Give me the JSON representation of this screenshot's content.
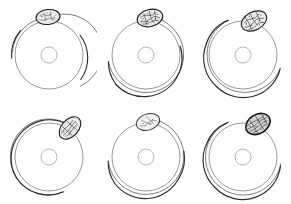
{
  "figure": {
    "background_color": "#ffffff",
    "grid": {
      "rows": 2,
      "columns": 3,
      "panel_count": 6
    },
    "colors": {
      "main_circle_stroke": "#8d8d91",
      "inner_circle_stroke": "#a9a9ad",
      "outer_arc_stroke": "#2b2b2e",
      "outer_arc_soft_stroke": "#6d6d72",
      "nodule_fill": "#e8e8e8",
      "nodule_outline": "#1d1d20"
    },
    "panels": [
      {
        "id": "panel-1",
        "position": {
          "row": 1,
          "column": 1
        },
        "main_circle": {
          "cx": 49,
          "cy": 55,
          "r": 34
        },
        "inner_circle": {
          "cx": 49,
          "cy": 55,
          "r": 8
        },
        "outer_arc": {
          "cx": 49,
          "cy": 55,
          "r": 37.5,
          "start_angle_deg": 182,
          "end_angle_deg": 55,
          "sweep": "clockwise-over-top",
          "clock_start": "9 o'clock",
          "clock_end": "4 o'clock"
        },
        "nodule": {
          "cx": 48,
          "cy": 17,
          "rx": 12,
          "ry": 7.5,
          "rotation_deg": -6,
          "clock_position": "12 o'clock",
          "texture": "stippled",
          "weight": "light"
        }
      },
      {
        "id": "panel-2",
        "position": {
          "row": 1,
          "column": 2
        },
        "main_circle": {
          "cx": 49,
          "cy": 55,
          "r": 34
        },
        "inner_circle": {
          "cx": 49,
          "cy": 55,
          "r": 8
        },
        "outer_arc": {
          "cx": 49,
          "cy": 55,
          "r": 38,
          "start_angle_deg": 168,
          "end_angle_deg": 292,
          "sweep": "counterclockwise-under-bottom",
          "clock_start": "9:30 o'clock",
          "clock_end": "2 o'clock"
        },
        "nodule": {
          "cx": 53,
          "cy": 18,
          "rx": 13,
          "ry": 8.5,
          "rotation_deg": -14,
          "clock_position": "12:30 o'clock",
          "texture": "stippled",
          "weight": "medium"
        }
      },
      {
        "id": "panel-3",
        "position": {
          "row": 1,
          "column": 3
        },
        "main_circle": {
          "cx": 49,
          "cy": 55,
          "r": 34
        },
        "inner_circle": {
          "cx": 49,
          "cy": 55,
          "r": 8
        },
        "outer_arc": {
          "cx": 49,
          "cy": 55,
          "r": 38,
          "start_angle_deg": 200,
          "end_angle_deg": 352,
          "sweep": "counterclockwise-under-bottom",
          "clock_start": "11 o'clock",
          "clock_end": "3 o'clock"
        },
        "nodule": {
          "cx": 60,
          "cy": 21,
          "rx": 13.5,
          "ry": 9,
          "rotation_deg": -28,
          "clock_position": "1 o'clock",
          "texture": "stippled",
          "weight": "medium"
        }
      },
      {
        "id": "panel-4",
        "position": {
          "row": 2,
          "column": 1
        },
        "main_circle": {
          "cx": 49,
          "cy": 55,
          "r": 34
        },
        "inner_circle": {
          "cx": 49,
          "cy": 55,
          "r": 8
        },
        "outer_arc": {
          "cx": 49,
          "cy": 55,
          "r": 38,
          "start_angle_deg": 220,
          "end_angle_deg": 65,
          "sweep": "counterclockwise-over-left",
          "clock_start": "1 o'clock",
          "clock_end": "5 o'clock"
        },
        "nodule": {
          "cx": 70,
          "cy": 26,
          "rx": 13,
          "ry": 8.5,
          "rotation_deg": -48,
          "clock_position": "1:30 o'clock",
          "texture": "striated",
          "weight": "medium"
        }
      },
      {
        "id": "panel-5",
        "position": {
          "row": 2,
          "column": 2
        },
        "main_circle": {
          "cx": 49,
          "cy": 55,
          "r": 34
        },
        "inner_circle": {
          "cx": 49,
          "cy": 55,
          "r": 8
        },
        "outer_arc": {
          "cx": 49,
          "cy": 55,
          "r": 38,
          "start_angle_deg": 172,
          "end_angle_deg": 350,
          "sweep": "counterclockwise-under-bottom",
          "clock_start": "9:30 o'clock",
          "clock_end": "3 o'clock"
        },
        "nodule": {
          "cx": 51,
          "cy": 20,
          "rx": 12,
          "ry": 8,
          "rotation_deg": -18,
          "clock_position": "12 o'clock",
          "texture": "sparse",
          "weight": "light"
        }
      },
      {
        "id": "panel-6",
        "position": {
          "row": 2,
          "column": 3
        },
        "main_circle": {
          "cx": 49,
          "cy": 55,
          "r": 34
        },
        "inner_circle": {
          "cx": 49,
          "cy": 55,
          "r": 8
        },
        "outer_arc": {
          "cx": 49,
          "cy": 55,
          "r": 38,
          "start_angle_deg": 205,
          "end_angle_deg": 358,
          "sweep": "counterclockwise-under-bottom",
          "clock_start": "11 o'clock",
          "clock_end": "3 o'clock"
        },
        "nodule": {
          "cx": 64,
          "cy": 22,
          "rx": 13,
          "ry": 9.5,
          "rotation_deg": -32,
          "clock_position": "1 o'clock",
          "texture": "striated-dense",
          "weight": "heavy"
        }
      }
    ]
  }
}
